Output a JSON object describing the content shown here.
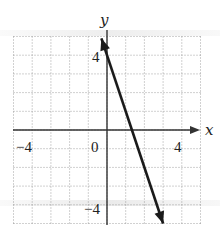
{
  "chart_data": {
    "type": "line",
    "title": "",
    "xlabel": "x",
    "ylabel": "y",
    "xlim": [
      -5,
      5
    ],
    "ylim": [
      -5,
      5
    ],
    "grid": true,
    "grid_style": "dotted",
    "x_tick_labels": [
      "-4",
      "0",
      "4"
    ],
    "y_tick_labels": [
      "4",
      "-4"
    ],
    "x_ticks": [
      -4,
      0,
      4
    ],
    "y_ticks": [
      4,
      -4
    ],
    "series": [
      {
        "name": "line",
        "equation": "y = -3x + 4",
        "slope": -3,
        "y_intercept": 4,
        "x_intercept": 1.333,
        "points": [
          [
            -0.3,
            4.9
          ],
          [
            0,
            4
          ],
          [
            1.333,
            0
          ],
          [
            3,
            -5
          ]
        ],
        "arrows_both_ends": true,
        "color": "#1a1a1a"
      }
    ],
    "legend": "none"
  },
  "labels": {
    "x_axis": "x",
    "y_axis": "y",
    "x_neg4": "−4",
    "origin": "0",
    "x_pos4": "4",
    "y_pos4": "4",
    "y_neg4": "−4"
  }
}
